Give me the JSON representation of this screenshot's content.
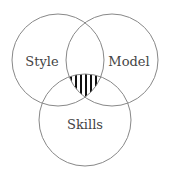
{
  "diagram": {
    "type": "venn",
    "sets": [
      {
        "label": "Style",
        "cx": 58,
        "cy": 60,
        "r": 46
      },
      {
        "label": "Model",
        "cx": 112,
        "cy": 60,
        "r": 46
      },
      {
        "label": "Skills",
        "cx": 85,
        "cy": 120,
        "r": 46
      }
    ],
    "highlighted_region": "intersection of Style, Model, Skills",
    "colors": {
      "stroke": "#888888",
      "hatch": "#111111",
      "text": "#444444"
    }
  }
}
